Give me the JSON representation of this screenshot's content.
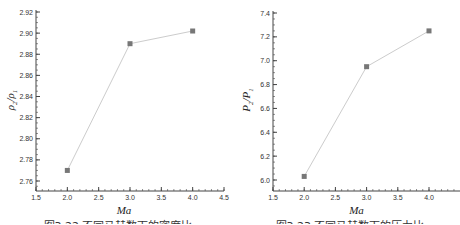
{
  "chart_data": [
    {
      "type": "line",
      "title": "",
      "xlabel": "Ma",
      "ylabel": "ρ2/ρ1",
      "x": [
        2.0,
        3.0,
        4.0
      ],
      "series": [
        {
          "name": "density ratio",
          "values": [
            2.77,
            2.89,
            2.902
          ]
        }
      ],
      "xlim": [
        1.5,
        4.5
      ],
      "ylim": [
        2.75,
        2.92
      ],
      "xticks": [
        "1.5",
        "2.0",
        "2.5",
        "3.0",
        "3.5",
        "4.0",
        "4.5"
      ],
      "yticks": [
        "2.76",
        "2.78",
        "2.80",
        "2.82",
        "2.84",
        "2.86",
        "2.88",
        "2.90",
        "2.92"
      ],
      "grid": false,
      "legend": null,
      "marker": "square",
      "caption": "图3.22 不同马赫数下的密度比"
    },
    {
      "type": "line",
      "title": "",
      "xlabel": "Ma",
      "ylabel": "P2/P1",
      "x": [
        2.0,
        3.0,
        4.0
      ],
      "series": [
        {
          "name": "pressure ratio",
          "values": [
            6.03,
            6.95,
            7.25
          ]
        }
      ],
      "xlim": [
        1.5,
        4.5
      ],
      "ylim": [
        5.9,
        7.4
      ],
      "xticks": [
        "1.5",
        "2.0",
        "2.5",
        "3.0",
        "3.5",
        "4.0",
        "4"
      ],
      "yticks": [
        "6.0",
        "6.2",
        "6.4",
        "6.6",
        "6.8",
        "7.0",
        "7.2",
        "7.4"
      ],
      "grid": false,
      "legend": null,
      "marker": "square",
      "caption": "图3.23 不同马赫数下的压力比"
    }
  ],
  "colors": {
    "axis": "#444444",
    "line": "#cccccc",
    "marker": "#777777"
  }
}
